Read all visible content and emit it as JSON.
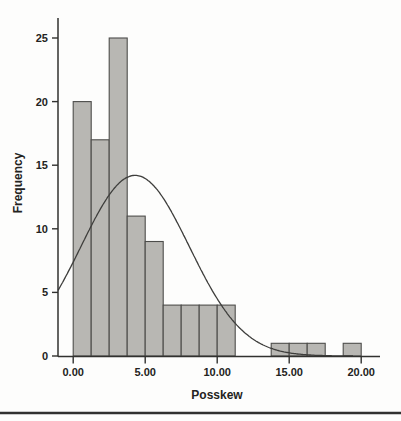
{
  "page": {
    "background_color": "#fdfdfc"
  },
  "chart_data": {
    "type": "bar",
    "subtype": "histogram-with-normal-curve",
    "title": "",
    "xlabel": "Posskew",
    "ylabel": "Frequency",
    "x_ticks": [
      {
        "value": 0,
        "label": "0.00"
      },
      {
        "value": 5,
        "label": "5.00"
      },
      {
        "value": 10,
        "label": "10.00"
      },
      {
        "value": 15,
        "label": "15.00"
      },
      {
        "value": 20,
        "label": "20.00"
      }
    ],
    "y_ticks": [
      {
        "value": 0,
        "label": "0"
      },
      {
        "value": 5,
        "label": "5"
      },
      {
        "value": 10,
        "label": "10"
      },
      {
        "value": 15,
        "label": "15"
      },
      {
        "value": 20,
        "label": "20"
      },
      {
        "value": 25,
        "label": "25"
      }
    ],
    "xlim": [
      -1.05,
      21.3
    ],
    "ylim": [
      0,
      26.6
    ],
    "grid": false,
    "legend": "none",
    "bin_width": 1.25,
    "bins": [
      {
        "start": 0.0,
        "end": 1.25,
        "frequency": 20
      },
      {
        "start": 1.25,
        "end": 2.5,
        "frequency": 17
      },
      {
        "start": 2.5,
        "end": 3.75,
        "frequency": 25
      },
      {
        "start": 3.75,
        "end": 5.0,
        "frequency": 11
      },
      {
        "start": 5.0,
        "end": 6.25,
        "frequency": 9
      },
      {
        "start": 6.25,
        "end": 7.5,
        "frequency": 4
      },
      {
        "start": 7.5,
        "end": 8.75,
        "frequency": 4
      },
      {
        "start": 8.75,
        "end": 10.0,
        "frequency": 4
      },
      {
        "start": 10.0,
        "end": 11.25,
        "frequency": 4
      },
      {
        "start": 13.75,
        "end": 15.0,
        "frequency": 1
      },
      {
        "start": 15.0,
        "end": 16.25,
        "frequency": 1
      },
      {
        "start": 16.25,
        "end": 17.5,
        "frequency": 1
      },
      {
        "start": 18.75,
        "end": 20.0,
        "frequency": 1
      }
    ],
    "normal_curve": {
      "mean": 4.3,
      "sd": 3.76,
      "peak_frequency": 14.2,
      "x_start": -1.05,
      "x_end": 19.5
    },
    "colors": {
      "bar_fill": "#b8b7b3",
      "bar_stroke": "#4d4d4b",
      "curve": "#3e3e3c",
      "axis": "#31312f",
      "text": "#232321",
      "separator": "#313130",
      "background": "#fdfdfc"
    }
  }
}
